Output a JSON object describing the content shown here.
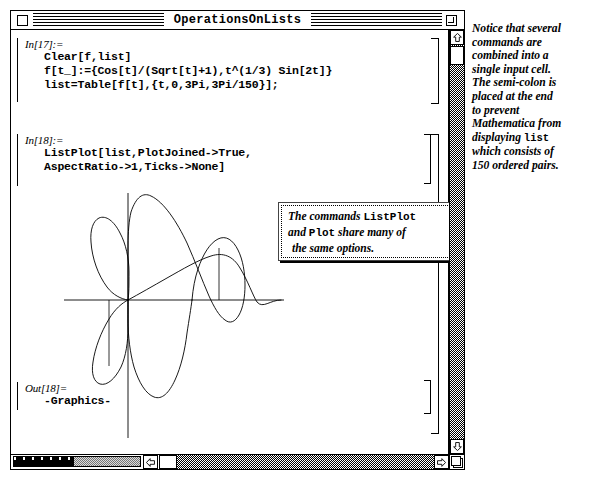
{
  "window": {
    "title": "OperationsOnLists",
    "close_box": "close-box",
    "zoom_box": "zoom-box"
  },
  "notebook": {
    "cells": [
      {
        "label": "In[17]:=",
        "type": "input",
        "lines": [
          "Clear[f,list]",
          "f[t_]:={Cos[t]/(Sqrt[t]+1),t^(1/3) Sin[2t]}",
          "list=Table[f[t],{t,0,3Pi,3Pi/150}];"
        ]
      },
      {
        "label": "In[18]:=",
        "type": "input",
        "lines": [
          "ListPlot[list,PlotJoined->True,",
          "AspectRatio->1,Ticks->None]"
        ]
      },
      {
        "label": "Out[18]=",
        "type": "output",
        "lines": [
          "-Graphics-"
        ]
      }
    ]
  },
  "callout": {
    "line1_a": "The commands ",
    "line1_b": "ListPlot",
    "line2_a": "and ",
    "line2_b": "Plot",
    "line2_c": " share many of",
    "line3": "the same options."
  },
  "margin_note": {
    "lines": [
      "Notice that several",
      "commands are",
      "combined into a",
      "single input cell.",
      "The semi-colon is",
      "placed at the end",
      "to prevent",
      "Mathematica from",
      "displaying list",
      "which consists of",
      "150 ordered pairs."
    ],
    "mono_word": "list",
    "mono_line_index": 8,
    "mono_line_prefix": "displaying "
  },
  "scrollbars": {
    "vertical_up_arrow": "⇧",
    "vertical_down_arrow": "⇩",
    "horizontal_left_arrow": "⇦",
    "horizontal_right_arrow": "⇨"
  },
  "chart_data": {
    "type": "line",
    "title": "",
    "xlabel": "",
    "ylabel": "",
    "grid": false,
    "legend": "none",
    "ticks": "None",
    "aspect_ratio": 1,
    "plot_joined": true,
    "axes_origin": [
      0,
      0
    ],
    "xlim": [
      -1.05,
      1.05
    ],
    "ylim": [
      -2.2,
      2.2
    ],
    "points_count": 151
  },
  "colors": {
    "window_bg": "#ffffff",
    "ink": "#000000",
    "scroll_track": "#b0b0b0"
  }
}
